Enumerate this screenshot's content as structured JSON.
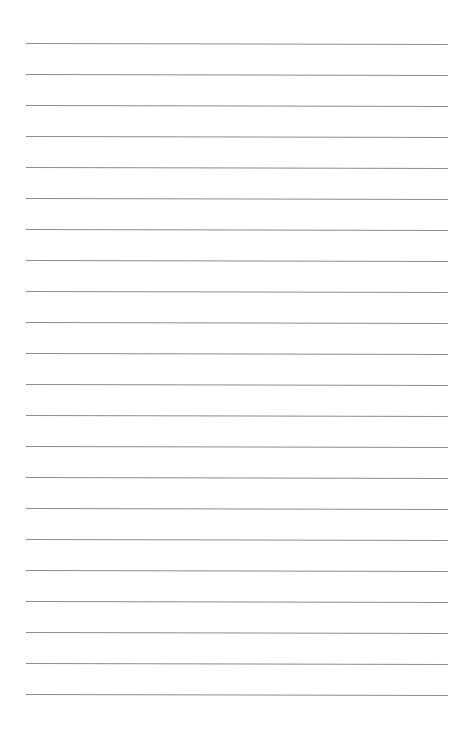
{
  "page": {
    "type": "lined-paper",
    "background_color": "#ffffff",
    "line_color": "#8c8c8c",
    "line_count": 22,
    "first_line_y": 43,
    "line_spacing": 31,
    "line_left": 26,
    "line_right": 448,
    "lines": [
      "",
      "",
      "",
      "",
      "",
      "",
      "",
      "",
      "",
      "",
      "",
      "",
      "",
      "",
      "",
      "",
      "",
      "",
      "",
      "",
      "",
      ""
    ]
  }
}
